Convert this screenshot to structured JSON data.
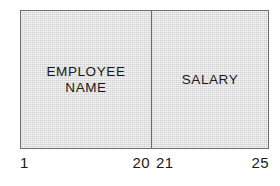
{
  "diagram": {
    "type": "record-layout",
    "fill_color": "#d6d6d6",
    "border_color": "#6e6e6e",
    "text_color": "#1a1a1a",
    "background_color": "#ffffff",
    "fields": [
      {
        "id": "employee-name",
        "label": "EMPLOYEE\nNAME",
        "start_column": "1",
        "end_column": "20",
        "width_columns": 20
      },
      {
        "id": "salary",
        "label": "SALARY",
        "start_column": "21",
        "end_column": "25",
        "width_columns": 5
      }
    ],
    "ruler": {
      "employee_start": "1",
      "employee_end": "20",
      "salary_start": "21",
      "salary_end": "25"
    }
  }
}
